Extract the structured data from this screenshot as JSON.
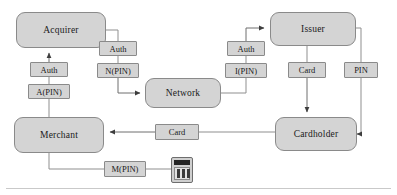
{
  "diagram": {
    "colors": {
      "node_fill": "#d4d4d4",
      "node_stroke": "#8a8a8a",
      "line": "#8f8f8f",
      "text": "#1a1a1a",
      "pinpad_screen": "#232323"
    },
    "nodes": [
      {
        "id": "acquirer",
        "label": "Acquirer",
        "x": 16,
        "y": 12,
        "w": 90,
        "h": 36
      },
      {
        "id": "network",
        "label": "Network",
        "x": 145,
        "y": 78,
        "w": 76,
        "h": 30
      },
      {
        "id": "issuer",
        "label": "Issuer",
        "x": 270,
        "y": 12,
        "w": 86,
        "h": 34
      },
      {
        "id": "merchant",
        "label": "Merchant",
        "x": 14,
        "y": 117,
        "w": 90,
        "h": 36
      },
      {
        "id": "cardholder",
        "label": "Cardholder",
        "x": 275,
        "y": 117,
        "w": 82,
        "h": 34
      }
    ],
    "messages": [
      {
        "id": "auth-acquirer",
        "label": "Auth",
        "x": 30,
        "y": 62,
        "w": 38,
        "h": 15
      },
      {
        "id": "apin",
        "label": "A(PIN)",
        "x": 28,
        "y": 84,
        "w": 42,
        "h": 15
      },
      {
        "id": "auth-network",
        "label": "Auth",
        "x": 99,
        "y": 41,
        "w": 38,
        "h": 15
      },
      {
        "id": "npin",
        "label": "N(PIN)",
        "x": 97,
        "y": 63,
        "w": 42,
        "h": 15
      },
      {
        "id": "auth-issuer",
        "label": "Auth",
        "x": 227,
        "y": 41,
        "w": 38,
        "h": 15
      },
      {
        "id": "ipin",
        "label": "I(PIN)",
        "x": 225,
        "y": 63,
        "w": 42,
        "h": 15
      },
      {
        "id": "card-issuer",
        "label": "Card",
        "x": 288,
        "y": 62,
        "w": 38,
        "h": 16
      },
      {
        "id": "pin-issuer",
        "label": "PIN",
        "x": 344,
        "y": 62,
        "w": 34,
        "h": 16
      },
      {
        "id": "card-merchant",
        "label": "Card",
        "x": 155,
        "y": 124,
        "w": 44,
        "h": 16
      },
      {
        "id": "mpin",
        "label": "M(PIN)",
        "x": 104,
        "y": 161,
        "w": 42,
        "h": 16
      }
    ],
    "devices": [
      {
        "id": "pin-pad",
        "name": "pin-pad-terminal",
        "x": 171,
        "y": 157,
        "w": 22,
        "h": 26
      }
    ]
  }
}
